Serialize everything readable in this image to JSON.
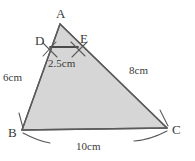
{
  "figure": {
    "type": "geometry-diagram",
    "shape": "triangle-with-midsegment",
    "background_color": "#ffffff",
    "fill_color": "#d6d6d6",
    "stroke_color": "#5a5a5a",
    "segment_color": "#4a4a4a",
    "tick_color": "#5a5a5a",
    "text_color": "#3a3a3a"
  },
  "vertices": [
    {
      "name": "A",
      "label": "A",
      "x": 60,
      "y": 24
    },
    {
      "name": "B",
      "label": "B",
      "x": 22,
      "y": 130
    },
    {
      "name": "C",
      "label": "C",
      "x": 167,
      "y": 128
    }
  ],
  "points": [
    {
      "name": "D",
      "label": "D",
      "x": 50,
      "y": 47,
      "on_side": "AB"
    },
    {
      "name": "E",
      "label": "E",
      "x": 78,
      "y": 47,
      "on_side": "AC"
    }
  ],
  "segments": [
    {
      "name": "AB",
      "from": "A",
      "to": "B"
    },
    {
      "name": "AC",
      "from": "A",
      "to": "C"
    },
    {
      "name": "BC",
      "from": "B",
      "to": "C"
    },
    {
      "name": "DE",
      "from": "D",
      "to": "E"
    }
  ],
  "measurements": {
    "DE": "2.5cm",
    "AB": "6cm",
    "AC": "8cm",
    "BC": "10cm"
  },
  "tick_marks": {
    "description": "crossing hatch strokes at D and E, arc strokes at B and C"
  }
}
